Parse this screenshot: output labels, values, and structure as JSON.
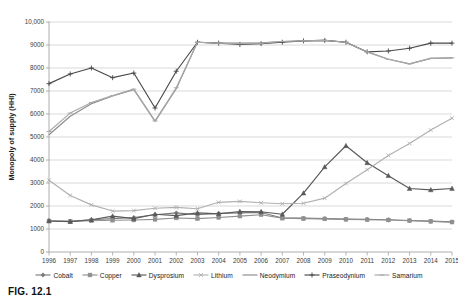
{
  "figure": {
    "caption": "FIG. 12.1"
  },
  "chart_data": {
    "type": "line",
    "title": "",
    "xlabel": "",
    "ylabel": "Monopoly of supply (HHI)",
    "ylim": [
      0,
      10000
    ],
    "ytick_labels": [
      "0",
      "1000",
      "2000",
      "3000",
      "4000",
      "5000",
      "6000",
      "7000",
      "8000",
      "9000",
      "10,000"
    ],
    "ytick_values": [
      0,
      1000,
      2000,
      3000,
      4000,
      5000,
      6000,
      7000,
      8000,
      9000,
      10000
    ],
    "grid": true,
    "legend_position": "bottom",
    "categories": [
      "1996",
      "1997",
      "1998",
      "1999",
      "2000",
      "2001",
      "2002",
      "2003",
      "2004",
      "2005",
      "2006",
      "2007",
      "2008",
      "2009",
      "2010",
      "2011",
      "2012",
      "2013",
      "2014",
      "2015"
    ],
    "x": [
      1996,
      1997,
      1998,
      1999,
      2000,
      2001,
      2002,
      2003,
      2004,
      2005,
      2006,
      2007,
      2008,
      2009,
      2010,
      2011,
      2012,
      2013,
      2014,
      2015
    ],
    "series": [
      {
        "name": "Cobalt",
        "color": "#7a7a7a",
        "marker": "diamond",
        "values": [
          1350,
          1330,
          1400,
          1450,
          1500,
          1620,
          1700,
          1620,
          1680,
          1700,
          1720,
          1480,
          1470,
          1450,
          1430,
          1420,
          1400,
          1370,
          1340,
          1310
        ]
      },
      {
        "name": "Copper",
        "color": "#8f8f8f",
        "marker": "square",
        "values": [
          1350,
          1330,
          1360,
          1380,
          1390,
          1420,
          1480,
          1450,
          1500,
          1560,
          1620,
          1470,
          1450,
          1440,
          1420,
          1400,
          1390,
          1360,
          1330,
          1300
        ]
      },
      {
        "name": "Dysprosium",
        "color": "#595959",
        "marker": "triangle",
        "values": [
          1350,
          1320,
          1400,
          1560,
          1450,
          1640,
          1580,
          1700,
          1660,
          1760,
          1750,
          1640,
          2560,
          3700,
          4620,
          3880,
          3320,
          2760,
          2700,
          2760
        ]
      },
      {
        "name": "Lithium",
        "color": "#b0b0b0",
        "marker": "cross",
        "values": [
          3120,
          2460,
          2050,
          1780,
          1800,
          1900,
          1940,
          1880,
          2160,
          2200,
          2140,
          2100,
          2120,
          2340,
          2980,
          3580,
          4200,
          4720,
          5300,
          5820
        ]
      },
      {
        "name": "Neodymium",
        "color": "#8c8c8c",
        "marker": "none",
        "values": [
          5100,
          5900,
          6450,
          6780,
          7060,
          5680,
          7100,
          9120,
          9080,
          9080,
          9100,
          9150,
          9180,
          9200,
          9120,
          8700,
          8380,
          8180,
          8420,
          8440
        ]
      },
      {
        "name": "Praseodynium",
        "color": "#4a4a4a",
        "marker": "plus",
        "values": [
          7320,
          7740,
          8000,
          7580,
          7780,
          6260,
          7860,
          9120,
          9080,
          9020,
          9060,
          9120,
          9180,
          9200,
          9120,
          8700,
          8740,
          8860,
          9080,
          9080
        ]
      },
      {
        "name": "Samarium",
        "color": "#a8a8a8",
        "marker": "dash",
        "values": [
          5240,
          6040,
          6500,
          6800,
          7080,
          5700,
          7140,
          9120,
          9080,
          9060,
          9080,
          9150,
          9180,
          9200,
          9120,
          8700,
          8380,
          8180,
          8420,
          8440
        ]
      }
    ]
  }
}
